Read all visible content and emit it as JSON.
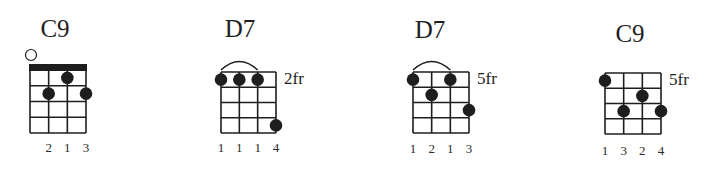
{
  "chords": [
    {
      "name": "C9",
      "position": "",
      "grid": {
        "x": 30,
        "top": 70,
        "string_gap": 18.67,
        "fret_gap": 15.75,
        "frets": 4
      },
      "nut": true,
      "barre": null,
      "open_strings": [
        1
      ],
      "dots": [
        {
          "string": 3,
          "fret": 1
        },
        {
          "string": 2,
          "fret": 2
        },
        {
          "string": 4,
          "fret": 2
        }
      ],
      "fingers": [
        "",
        "2",
        "1",
        "3"
      ],
      "title_x": 55,
      "title_y": 37,
      "finger_y": 152
    },
    {
      "name": "D7",
      "position": "2fr",
      "grid": {
        "x": 221,
        "top": 72,
        "string_gap": 18.33,
        "fret_gap": 15.25,
        "frets": 4
      },
      "nut": false,
      "barre": {
        "from": 1,
        "to": 3
      },
      "open_strings": [],
      "dots": [
        {
          "string": 1,
          "fret": 1
        },
        {
          "string": 2,
          "fret": 1
        },
        {
          "string": 3,
          "fret": 1
        },
        {
          "string": 4,
          "fret": 4
        }
      ],
      "fingers": [
        "1",
        "1",
        "1",
        "4"
      ],
      "title_x": 240,
      "title_y": 37,
      "finger_y": 152
    },
    {
      "name": "D7",
      "position": "5fr",
      "grid": {
        "x": 413,
        "top": 72,
        "string_gap": 18.67,
        "fret_gap": 15.25,
        "frets": 4
      },
      "nut": false,
      "barre": {
        "from": 1,
        "to": 3
      },
      "open_strings": [],
      "dots": [
        {
          "string": 1,
          "fret": 1
        },
        {
          "string": 3,
          "fret": 1
        },
        {
          "string": 2,
          "fret": 2
        },
        {
          "string": 4,
          "fret": 3
        }
      ],
      "fingers": [
        "1",
        "2",
        "1",
        "3"
      ],
      "title_x": 430,
      "title_y": 38,
      "finger_y": 153
    },
    {
      "name": "C9",
      "position": "5fr",
      "grid": {
        "x": 605,
        "top": 73,
        "string_gap": 18.67,
        "fret_gap": 15.25,
        "frets": 4
      },
      "nut": false,
      "barre": null,
      "open_strings": [],
      "dots": [
        {
          "string": 1,
          "fret": 1
        },
        {
          "string": 3,
          "fret": 2
        },
        {
          "string": 2,
          "fret": 3
        },
        {
          "string": 4,
          "fret": 3
        }
      ],
      "fingers": [
        "1",
        "3",
        "2",
        "4"
      ],
      "title_x": 630,
      "title_y": 42,
      "finger_y": 155
    }
  ],
  "colors": {
    "ink": "#1e1e1e",
    "background": "#ffffff"
  }
}
